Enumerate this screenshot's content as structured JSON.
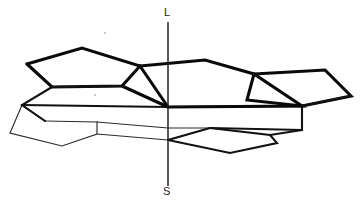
{
  "figure": {
    "background_color": "#ffffff",
    "stroke_color": "#0a0a0a",
    "width": 360,
    "height": 209
  },
  "axis": {
    "name": "vertical-reference-axis",
    "top_label": "L",
    "bottom_label": "S",
    "x": 168,
    "y_top": 22,
    "y_bottom": 186,
    "color": "#222222"
  },
  "chart_data": {
    "type": "diagram",
    "xlabel": "",
    "ylabel": "",
    "legend": [],
    "annotations": [
      {
        "text": "L",
        "x": 168,
        "y": 13
      },
      {
        "text": "S",
        "x": 167,
        "y": 192
      }
    ],
    "center_point": {
      "x": 168,
      "y": 107
    },
    "vertices": {
      "a1": [
        27,
        64
      ],
      "a2": [
        82,
        48
      ],
      "a3": [
        140,
        66
      ],
      "a4": [
        122,
        86
      ],
      "a5": [
        52,
        87
      ],
      "b1": [
        205,
        60
      ],
      "b2": [
        254,
        74
      ],
      "b3": [
        325,
        70
      ],
      "b4": [
        351,
        96
      ],
      "b5": [
        302,
        106
      ],
      "c1": [
        22,
        105
      ],
      "c2": [
        10,
        133
      ],
      "c3": [
        45,
        121
      ],
      "c4": [
        62,
        146
      ],
      "c5": [
        97,
        122
      ],
      "c6": [
        97,
        134
      ],
      "d1": [
        210,
        128
      ],
      "d2": [
        270,
        135
      ],
      "d3": [
        277,
        143
      ],
      "d4": [
        230,
        153
      ],
      "d5": [
        302,
        130
      ]
    },
    "paths": [
      {
        "id": "upper-left-ring",
        "weight": "bold",
        "points": "27,64 82,48 140,66 168,107 122,86 52,87 27,64"
      },
      {
        "id": "upper-right-ring",
        "weight": "bold",
        "points": "168,107 205,60 254,74 302,106 168,107"
      },
      {
        "id": "far-right-ring",
        "weight": "bold",
        "points": "254,74 325,70 351,96 302,106"
      },
      {
        "id": "middle-left-ring",
        "weight": "medium",
        "points": "52,87 22,105 45,121 168,107"
      },
      {
        "id": "middle-right-ring",
        "weight": "medium",
        "points": "168,107 302,106 302,130 210,128"
      },
      {
        "id": "lower-left-ring",
        "weight": "thin",
        "points": "22,105 10,133 62,146 97,134 97,122 45,121"
      },
      {
        "id": "lower-middle-ring",
        "weight": "thin",
        "points": "97,134 168,140 210,128"
      },
      {
        "id": "lower-right-ring",
        "weight": "medium",
        "points": "210,128 270,135 277,143 230,153 168,140"
      },
      {
        "id": "lower-right-tail",
        "weight": "medium",
        "points": "270,135 302,130"
      }
    ]
  },
  "strokes": {
    "bold_width": 3.1,
    "medium_width": 2.1,
    "thin_width": 1.15
  }
}
